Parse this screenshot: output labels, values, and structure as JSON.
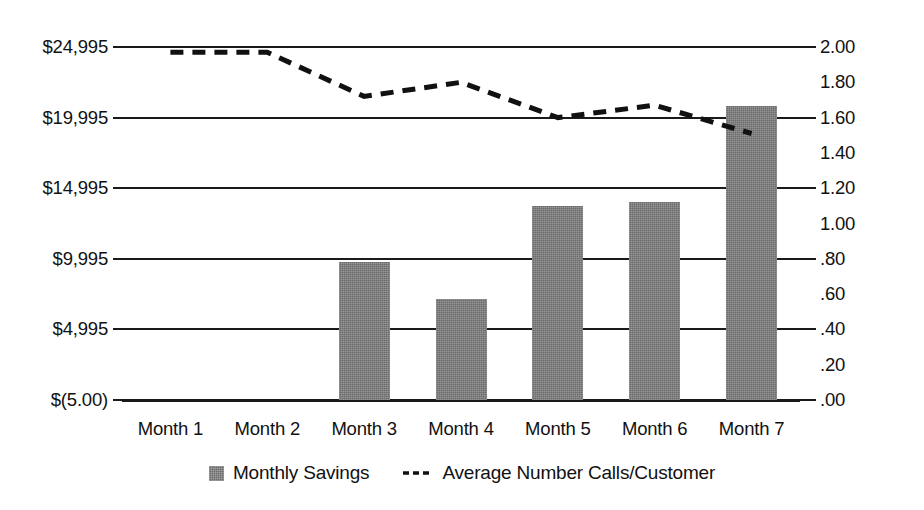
{
  "chart_data": {
    "type": "bar",
    "title": "",
    "xlabel": "",
    "categories": [
      "Month 1",
      "Month 2",
      "Month 3",
      "Month 4",
      "Month 5",
      "Month 6",
      "Month 7"
    ],
    "grid": true,
    "legend_position": "bottom",
    "series": [
      {
        "name": "Monthly Savings",
        "type": "bar",
        "axis": "left",
        "values": [
          0,
          0,
          9800,
          7150,
          13700,
          14000,
          20800
        ],
        "color": "#6b6b6b"
      },
      {
        "name": "Average Number Calls/Customer",
        "type": "line",
        "axis": "right",
        "style": "dashed",
        "values": [
          1.97,
          1.97,
          1.72,
          1.8,
          1.6,
          1.67,
          1.51
        ],
        "color": "#111111"
      }
    ],
    "left_axis": {
      "label": "",
      "ylim": [
        -5,
        24995
      ],
      "tick_labels": [
        "$24,995",
        "$19,995",
        "$14,995",
        "$9,995",
        "$4,995",
        "$(5.00)"
      ],
      "tick_values": [
        24995,
        19995,
        14995,
        9995,
        4995,
        -5
      ]
    },
    "right_axis": {
      "label": "",
      "ylim": [
        0.0,
        2.0
      ],
      "tick_labels": [
        "2.00",
        "1.80",
        "1.60",
        "1.40",
        "1.20",
        "1.00",
        ".80",
        ".60",
        ".40",
        ".20",
        ".00"
      ],
      "tick_values": [
        2.0,
        1.8,
        1.6,
        1.4,
        1.2,
        1.0,
        0.8,
        0.6,
        0.4,
        0.2,
        0.0
      ],
      "gridline_values": [
        2.0,
        1.6,
        1.2,
        0.8,
        0.4,
        0.0
      ]
    }
  },
  "legend": {
    "items": [
      {
        "label": "Monthly Savings",
        "marker": "filled-square-swatch"
      },
      {
        "label": "Average Number Calls/Customer",
        "marker": "dashed-line-swatch"
      }
    ]
  }
}
